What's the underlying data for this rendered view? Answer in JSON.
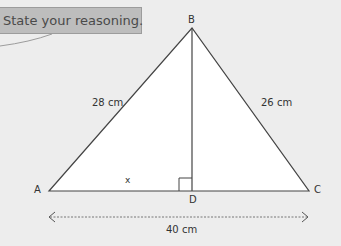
{
  "callout": {
    "text": "State your reasoning."
  },
  "diagram": {
    "vertices": {
      "A": "A",
      "B": "B",
      "C": "C",
      "D": "D"
    },
    "side_labels": {
      "AB": "28 cm",
      "BC": "26 cm",
      "AD": "x",
      "AC": "40 cm"
    },
    "right_angle_at": "D",
    "colors": {
      "background": "#ededed",
      "triangle_fill": "#ffffff",
      "stroke": "#444444",
      "callout_fill": "#bdbdbd"
    }
  }
}
